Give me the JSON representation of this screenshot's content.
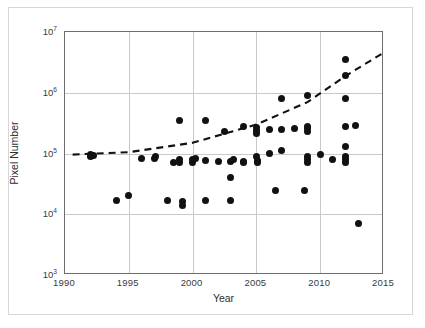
{
  "chart_data": {
    "type": "scatter",
    "title": "",
    "xlabel": "Year",
    "ylabel": "Pixel Number",
    "xlim": [
      1990,
      2015
    ],
    "ylim": [
      1000,
      10000000
    ],
    "yscale": "log",
    "xticks": [
      1990,
      1995,
      2000,
      2005,
      2010,
      2015
    ],
    "xtick_labels": [
      "1990",
      "1995",
      "2000",
      "2005",
      "2010",
      "2015"
    ],
    "yticks": [
      1000,
      10000,
      100000,
      1000000,
      10000000
    ],
    "ytick_labels": [
      "10³",
      "10⁴",
      "10⁵",
      "10⁶",
      "10⁷"
    ],
    "ytick_mantissa": [
      "10",
      "10",
      "10",
      "10",
      "10"
    ],
    "ytick_exponent": [
      "3",
      "4",
      "5",
      "6",
      "7"
    ],
    "grid": true,
    "legend": null,
    "series": [
      {
        "name": "Sensor pixel number",
        "marker": "filled-circle",
        "color": "#111111",
        "points": [
          [
            1992.0,
            95000
          ],
          [
            1992.0,
            88000
          ],
          [
            1992.2,
            92000
          ],
          [
            1994.0,
            17000
          ],
          [
            1995.0,
            20000
          ],
          [
            1996.0,
            82000
          ],
          [
            1997.0,
            83000
          ],
          [
            1997.1,
            90000
          ],
          [
            1998.0,
            17000
          ],
          [
            1998.5,
            70000
          ],
          [
            1999.0,
            350000
          ],
          [
            1999.0,
            80000
          ],
          [
            1999.0,
            72000
          ],
          [
            1999.2,
            16500
          ],
          [
            1999.2,
            14000
          ],
          [
            2000.0,
            80000
          ],
          [
            2000.0,
            72000
          ],
          [
            2000.2,
            84000
          ],
          [
            2001.0,
            350000
          ],
          [
            2001.0,
            78000
          ],
          [
            2001.0,
            17000
          ],
          [
            2002.0,
            75000
          ],
          [
            2002.5,
            230000
          ],
          [
            2003.0,
            74000
          ],
          [
            2003.0,
            40000
          ],
          [
            2003.0,
            17000
          ],
          [
            2003.2,
            80000
          ],
          [
            2004.0,
            280000
          ],
          [
            2004.0,
            75000
          ],
          [
            2004.0,
            72000
          ],
          [
            2005.0,
            270000
          ],
          [
            2005.0,
            240000
          ],
          [
            2005.0,
            215000
          ],
          [
            2005.0,
            90000
          ],
          [
            2005.1,
            78000
          ],
          [
            2005.1,
            70000
          ],
          [
            2006.0,
            250000
          ],
          [
            2006.0,
            100000
          ],
          [
            2006.5,
            25000
          ],
          [
            2007.0,
            800000
          ],
          [
            2007.0,
            250000
          ],
          [
            2007.0,
            110000
          ],
          [
            2008.0,
            260000
          ],
          [
            2008.8,
            25000
          ],
          [
            2009.0,
            900000
          ],
          [
            2009.0,
            280000
          ],
          [
            2009.0,
            260000
          ],
          [
            2009.0,
            230000
          ],
          [
            2009.0,
            90000
          ],
          [
            2009.0,
            80000
          ],
          [
            2009.0,
            72000
          ],
          [
            2010.0,
            95000
          ],
          [
            2011.0,
            80000
          ],
          [
            2012.0,
            3500000
          ],
          [
            2012.0,
            1900000
          ],
          [
            2012.0,
            800000
          ],
          [
            2012.0,
            280000
          ],
          [
            2012.0,
            130000
          ],
          [
            2012.0,
            90000
          ],
          [
            2012.0,
            80000
          ],
          [
            2012.0,
            72000
          ],
          [
            2012.8,
            290000
          ],
          [
            2013.0,
            7000
          ]
        ]
      }
    ],
    "trendline": {
      "style": "dashed",
      "color": "#111111",
      "points": [
        [
          1990.6,
          96000
        ],
        [
          1995.0,
          105000
        ],
        [
          2000.0,
          150000
        ],
        [
          2005.0,
          300000
        ],
        [
          2009.0,
          700000
        ],
        [
          2012.0,
          1900000
        ],
        [
          2015.0,
          4600000
        ]
      ]
    }
  }
}
